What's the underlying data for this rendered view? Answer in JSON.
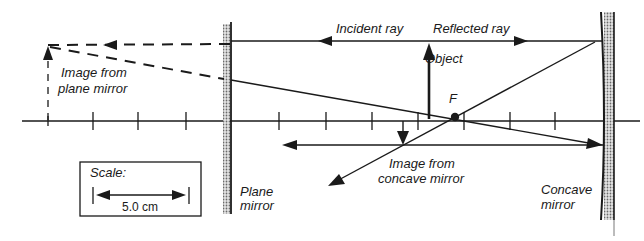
{
  "diagram": {
    "labels": {
      "incident_ray": "Incident ray",
      "reflected_ray": "Reflected ray",
      "object": "Object",
      "focal_point": "F",
      "image_plane_line1": "Image from",
      "image_plane_line2": "plane mirror",
      "image_concave_line1": "Image from",
      "image_concave_line2": "concave mirror",
      "plane_mirror_line1": "Plane",
      "plane_mirror_line2": "mirror",
      "concave_mirror_line1": "Concave",
      "concave_mirror_line2": "mirror"
    },
    "scale": {
      "title": "Scale:",
      "value": "5.0 cm"
    },
    "colors": {
      "ink": "#1a1a1a",
      "mirror_fill": "#9a9a9a",
      "background": "#ffffff"
    }
  }
}
